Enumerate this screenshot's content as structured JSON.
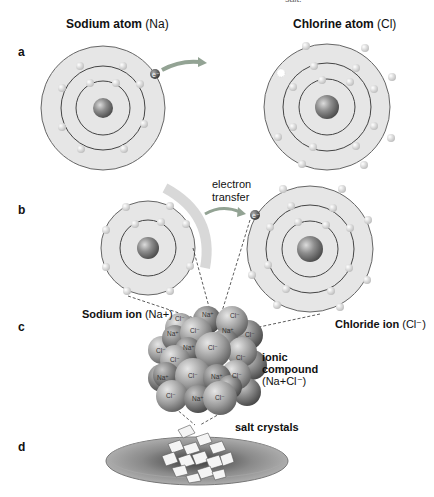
{
  "top_fragment": "salt.",
  "panels": {
    "a": {
      "letter": "a",
      "sodium_title_bold": "Sodium atom",
      "sodium_title_sym": "(Na)",
      "chlorine_title_bold": "Chlorine atom",
      "chlorine_title_sym": "(Cl)",
      "electron_label": "e⁻",
      "sodium_shells": [
        2,
        8,
        1
      ],
      "chlorine_shells": [
        2,
        8,
        7
      ]
    },
    "b": {
      "letter": "b",
      "transfer_line1": "electron",
      "transfer_line2": "transfer",
      "electron_label": "e⁻",
      "sodium_shells": [
        2,
        8
      ],
      "chloride_shells": [
        2,
        8,
        8
      ]
    },
    "c": {
      "letter": "c",
      "sodium_ion_bold": "Sodium ion",
      "sodium_ion_sym": "(Na+)",
      "chloride_ion_bold": "Chloride ion",
      "chloride_ion_sym": "(Cl⁻)",
      "compound_line1": "ionic",
      "compound_line2": "compound",
      "compound_formula": "(Na+Cl⁻)",
      "lattice_labels": [
        "Cl⁻",
        "Na⁺"
      ]
    },
    "d": {
      "letter": "d",
      "crystals_label": "salt crystals"
    }
  },
  "colors": {
    "shell_fill": "#e4e4e4",
    "shell_stroke": "#555555",
    "nucleus": "#8a8a8a",
    "electron": "#f2f2f2",
    "arrow": "#8c9a8c",
    "plate": "#8d8d8d"
  }
}
